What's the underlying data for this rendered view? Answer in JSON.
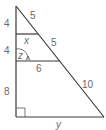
{
  "diagram": {
    "type": "similar-triangles",
    "segments": {
      "left_top": "4",
      "left_middle": "4",
      "left_bottom": "8",
      "hyp_top": "5",
      "hyp_middle": "5",
      "hyp_bottom": "10",
      "first_parallel": "x",
      "second_parallel": "6",
      "base": "y"
    },
    "angle_label": "z",
    "right_angle": true
  }
}
